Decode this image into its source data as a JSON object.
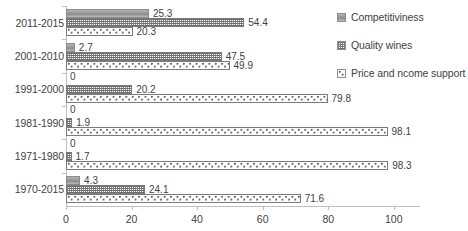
{
  "chart_data": {
    "type": "bar",
    "orientation": "horizontal",
    "title": "",
    "xlabel": "",
    "ylabel": "",
    "xlim": [
      0,
      108
    ],
    "xticks": [
      0,
      20,
      40,
      60,
      80,
      100
    ],
    "xtick_labels": [
      "0",
      "20",
      "40",
      "60",
      "80",
      "100"
    ],
    "grid": false,
    "legend_position": "right",
    "categories": [
      "2011-2015",
      "2001-2010",
      "1991-2000",
      "1981-1990",
      "1971-1980",
      "1970-2015"
    ],
    "series": [
      {
        "name": "Competitiviness",
        "pattern": "solid-grey",
        "values": [
          25.3,
          2.7,
          0,
          0,
          0,
          4.3
        ],
        "labels": [
          "25.3",
          "2.7",
          "0",
          "0",
          "0",
          "4.3"
        ]
      },
      {
        "name": "Quality wines",
        "pattern": "fine-grid",
        "values": [
          54.4,
          47.5,
          20.2,
          1.9,
          1.7,
          24.1
        ],
        "labels": [
          "54.4",
          "47.5",
          "20.2",
          "1.9",
          "1.7",
          "24.1"
        ]
      },
      {
        "name": "Price and ncome support",
        "pattern": "circles",
        "values": [
          20.3,
          49.9,
          79.8,
          98.1,
          98.3,
          71.6
        ],
        "labels": [
          "20.3",
          "49.9",
          "79.8",
          "98.1",
          "98.3",
          "71.6"
        ]
      }
    ]
  },
  "legend": {
    "items": [
      {
        "label": "Competitiviness"
      },
      {
        "label": "Quality wines"
      },
      {
        "label": "Price and ncome support"
      }
    ]
  },
  "colors": {
    "axis": "#bfbfbf",
    "text": "#3f3f3f",
    "series1": "#9d9d9d",
    "series2": "#7a7a7a",
    "series3": "#595959",
    "background": "#ffffff"
  }
}
